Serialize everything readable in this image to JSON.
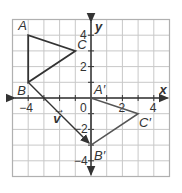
{
  "diagram": {
    "type": "coordinate-plane-translation",
    "grid": {
      "xmin": -5,
      "xmax": 5,
      "ymin": -5,
      "ymax": 5,
      "unit_px": 15.7,
      "origin_px": [
        91,
        98
      ],
      "grid_color": "#c8c8c8",
      "border_color": "#b0b0b0"
    },
    "axes": {
      "x_label": "x",
      "y_label": "y",
      "color": "#333333"
    },
    "x_ticks": [
      {
        "value": -4,
        "label": "−4"
      },
      {
        "value": 2,
        "label": "2"
      },
      {
        "value": 4,
        "label": "4"
      }
    ],
    "y_ticks": [
      {
        "value": 4,
        "label": "4"
      },
      {
        "value": 2,
        "label": "2"
      },
      {
        "value": -2,
        "label": "−2"
      },
      {
        "value": -4,
        "label": "−4"
      }
    ],
    "origin_label": "0",
    "preimage": {
      "name": "triangle ABC",
      "vertices": [
        {
          "label": "A",
          "x": -4,
          "y": 4
        },
        {
          "label": "B",
          "x": -4,
          "y": 1
        },
        {
          "label": "C",
          "x": -1,
          "y": 3
        }
      ],
      "color": "#333333"
    },
    "image": {
      "name": "triangle A'B'C'",
      "vertices": [
        {
          "label": "A′",
          "x": 0,
          "y": 0
        },
        {
          "label": "B′",
          "x": 0,
          "y": -3
        },
        {
          "label": "C′",
          "x": 3,
          "y": -1
        }
      ],
      "color": "#555555"
    },
    "vector": {
      "label": "v",
      "from": [
        -4,
        1
      ],
      "to": [
        0,
        -3
      ],
      "color": "#333333"
    }
  }
}
